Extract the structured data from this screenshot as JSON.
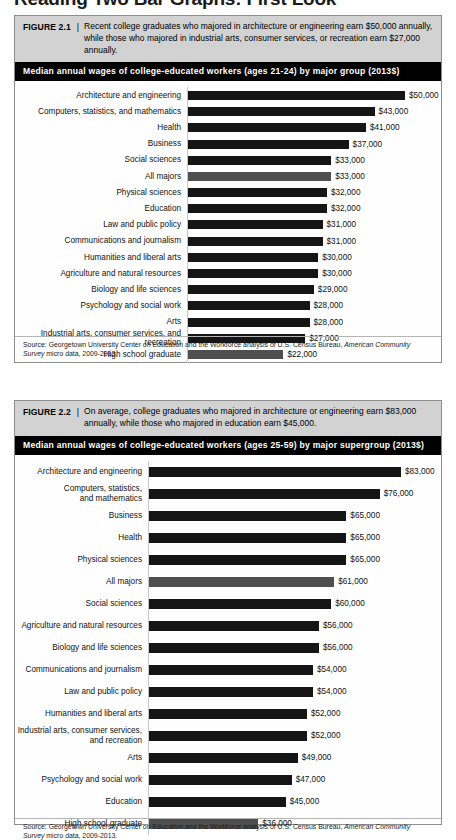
{
  "page": {
    "heading": "Reading Two Bar Graphs: First Look"
  },
  "figures": [
    {
      "id": "figure-1",
      "label": "FIGURE 2.1",
      "separator": "|",
      "caption": "Recent college graduates who majored in architecture or engineering earn $50,000 annually, while those who majored in industrial arts, consumer services, or recreation earn $27,000 annually.",
      "subtitle": "Median annual wages of college-educated workers (ages 21-24) by major group (2013$)",
      "source_prefix": "Source: Georgetown University Center on Education and the Workforce analysis of U.S. Census Bureau, ",
      "source_italic": "American Community Survey",
      "source_suffix": " micro data, 2009-2013."
    },
    {
      "id": "figure-2",
      "label": "FIGURE 2.2",
      "separator": "|",
      "caption": "On average, college graduates who majored in architecture or engineering earn $83,000 annually, while those who majored in education earn $45,000.",
      "subtitle": "Median annual wages of college-educated workers (ages 25-59) by major supergroup (2013$)",
      "source_prefix": "Source: Georgetown University Center on Education and the Workforce analysis of U.S. Census Bureau, ",
      "source_italic": "American Community Survey",
      "source_suffix": " micro data, 2009-2013."
    }
  ],
  "colors": {
    "bar_default": "#151515",
    "bar_highlight": "#4f4f4f",
    "caption_band": "#d2d2d2",
    "subtitle_band": "#000000",
    "figure_border": "#8e8e8e"
  },
  "chart_data": [
    {
      "type": "bar",
      "orientation": "horizontal",
      "title": "Median annual wages of college-educated workers (ages 21-24) by major group (2013$)",
      "xlabel": "",
      "ylabel": "",
      "xlim": [
        0,
        50000
      ],
      "grid": false,
      "legend": false,
      "value_prefix": "$",
      "categories": [
        "Architecture and engineering",
        "Computers, statistics, and mathematics",
        "Health",
        "Business",
        "Social sciences",
        "All majors",
        "Physical sciences",
        "Education",
        "Law and public policy",
        "Communications and journalism",
        "Humanities and liberal arts",
        "Agriculture and natural resources",
        "Biology and life sciences",
        "Psychology and social work",
        "Arts",
        "Industrial arts, consumer services, and recreation",
        "High school graduate"
      ],
      "values": [
        50000,
        43000,
        41000,
        37000,
        33000,
        33000,
        32000,
        32000,
        31000,
        31000,
        30000,
        30000,
        29000,
        28000,
        28000,
        27000,
        22000
      ],
      "labels": [
        "$50,000",
        "$43,000",
        "$41,000",
        "$37,000",
        "$33,000",
        "$33,000",
        "$32,000",
        "$32,000",
        "$31,000",
        "$31,000",
        "$30,000",
        "$30,000",
        "$29,000",
        "$28,000",
        "$28,000",
        "$27,000",
        "$22,000"
      ],
      "highlighted": [
        false,
        false,
        false,
        false,
        false,
        true,
        false,
        false,
        false,
        false,
        false,
        false,
        false,
        false,
        false,
        false,
        true
      ]
    },
    {
      "type": "bar",
      "orientation": "horizontal",
      "title": "Median annual wages of college-educated workers (ages 25-59) by major supergroup (2013$)",
      "xlabel": "",
      "ylabel": "",
      "xlim": [
        0,
        83000
      ],
      "grid": false,
      "legend": false,
      "value_prefix": "$",
      "categories": [
        "Architecture and engineering",
        "Computers, statistics,\nand mathematics",
        "Business",
        "Health",
        "Physical sciences",
        "All majors",
        "Social sciences",
        "Agriculture and natural resources",
        "Biology and life sciences",
        "Communications and journalism",
        "Law and public policy",
        "Humanities and liberal arts",
        "Industrial arts, consumer services,\nand recreation",
        "Arts",
        "Psychology and social work",
        "Education",
        "High school graduate"
      ],
      "values": [
        83000,
        76000,
        65000,
        65000,
        65000,
        61000,
        60000,
        56000,
        56000,
        54000,
        54000,
        52000,
        52000,
        49000,
        47000,
        45000,
        36000
      ],
      "labels": [
        "$83,000",
        "$76,000",
        "$65,000",
        "$65,000",
        "$65,000",
        "$61,000",
        "$60,000",
        "$56,000",
        "$56,000",
        "$54,000",
        "$54,000",
        "$52,000",
        "$52,000",
        "$49,000",
        "$47,000",
        "$45,000",
        "$36,000"
      ],
      "highlighted": [
        false,
        false,
        false,
        false,
        false,
        true,
        false,
        false,
        false,
        false,
        false,
        false,
        false,
        false,
        false,
        false,
        true
      ]
    }
  ]
}
